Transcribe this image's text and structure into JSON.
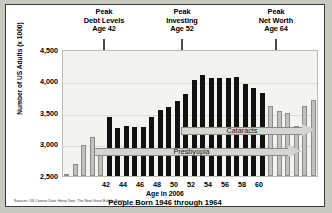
{
  "figure": {
    "subtitle": "People Born 1946 through 1964",
    "sources": "Sources:  US Census Data; Harry Dent, The Next Great Bubble Boom"
  },
  "annotations": [
    {
      "line1": "Peak",
      "line2": "Debt Levels",
      "line3": "Age 42",
      "age": 42
    },
    {
      "line1": "Peak",
      "line2": "Investing",
      "line3": "Age 52",
      "age": 52
    },
    {
      "line1": "Peak",
      "line2": "Net Worth",
      "line3": "Age 64",
      "age": 64
    }
  ],
  "banners": [
    {
      "label": "Cataracts"
    },
    {
      "label": "Presbyopia"
    }
  ],
  "colors": {
    "bar_dark": "#111111",
    "bar_light": "#c2c2bc",
    "plot_bg": "#f3f3f0",
    "frame_bg": "#ffffff",
    "page_bg": "#c9c9c4",
    "arrow": "#4a4a4a",
    "banner": "#d6d6d0"
  },
  "chart_data": {
    "type": "bar",
    "title": "",
    "subtitle": "People Born 1946 through 1964",
    "xlabel": "Age in 2006",
    "ylabel": "Number of US Adults (x 1000)",
    "ylim": [
      2500,
      4500
    ],
    "yticks": [
      2500,
      3000,
      3500,
      4000,
      4500
    ],
    "ytick_labels": [
      "2,500",
      "3,000",
      "3,500",
      "4,000",
      "4,500"
    ],
    "xticks": [
      42,
      44,
      46,
      48,
      50,
      52,
      54,
      56,
      58,
      60
    ],
    "xtick_labels": [
      "42",
      "44",
      "46",
      "48",
      "50",
      "52",
      "54",
      "56",
      "58",
      "60"
    ],
    "grid": true,
    "legend": "none",
    "highlight_note": "Dark bars = baby boomers (born 1946-1964, ages 42-60 in 2006); light bars = adjacent cohorts",
    "categories": [
      37,
      38,
      39,
      40,
      41,
      42,
      43,
      44,
      45,
      46,
      47,
      48,
      49,
      50,
      51,
      52,
      53,
      54,
      55,
      56,
      57,
      58,
      59,
      60,
      61,
      62,
      63,
      64,
      65,
      66
    ],
    "values": [
      2530,
      2700,
      3000,
      3120,
      2950,
      3440,
      3270,
      3300,
      3290,
      3290,
      3450,
      3550,
      3600,
      3700,
      3810,
      4030,
      4110,
      4070,
      4070,
      4070,
      4080,
      3970,
      3910,
      3830,
      3620,
      3540,
      3510,
      3300,
      3620,
      3710
    ],
    "highlighted": [
      false,
      false,
      false,
      false,
      false,
      true,
      true,
      true,
      true,
      true,
      true,
      true,
      true,
      true,
      true,
      true,
      true,
      true,
      true,
      true,
      true,
      true,
      true,
      true,
      false,
      false,
      false,
      false,
      false,
      false
    ]
  }
}
